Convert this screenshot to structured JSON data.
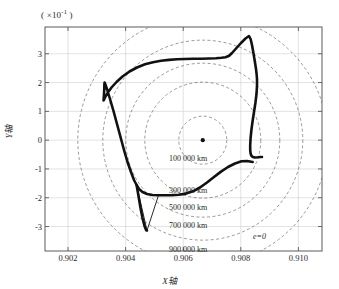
{
  "figure": {
    "exponent_note": "( ×10",
    "exponent_power": "-1",
    "exponent_close": " )",
    "x_axis_label": "X轴",
    "y_axis_label": "Y轴",
    "eccentricity_note": "e=0"
  },
  "chart_data": {
    "type": "line",
    "title": "",
    "subtitle": "",
    "xlabel": "X轴",
    "ylabel": "Y轴",
    "y_scale_note": "( ×10^-1 )",
    "grid": true,
    "legend_position": "none",
    "xlim": [
      0.9012,
      0.91082
    ],
    "ylim": [
      -0.385,
      0.393
    ],
    "x_ticks": [
      0.902,
      0.904,
      0.906,
      0.908,
      0.91
    ],
    "x_tick_labels": [
      "0.902",
      "0.904",
      "0.906",
      "0.908",
      "0.910"
    ],
    "y_ticks": [
      3,
      2,
      1,
      0,
      -1,
      -2,
      -3
    ],
    "y_tick_labels": [
      "3",
      "2",
      "1",
      "0",
      "-1",
      "-2",
      "-3"
    ],
    "center": {
      "x": 0.90668,
      "y": 0.0
    },
    "center_marker": "dot",
    "rings": [
      {
        "label": "100 000 km",
        "radius_px": 24,
        "label_y": 154
      },
      {
        "label": "300 000 km",
        "radius_px": 58,
        "label_y": 186
      },
      {
        "label": "500 000 km",
        "radius_px": 77,
        "label_y": 203
      },
      {
        "label": "700 000 km",
        "radius_px": 100,
        "label_y": 221
      },
      {
        "label": "900 000 km",
        "radius_px": 125,
        "label_y": 245
      }
    ],
    "ring_label_x": 188,
    "series": [
      {
        "name": "trajectory",
        "color": "#111111",
        "linewidth": 2.6,
        "closed": false,
        "points_px": [
          [
            252.7,
            162.0
          ],
          [
            247.0,
            161.0
          ],
          [
            241.5,
            161.3
          ],
          [
            235.0,
            163.5
          ],
          [
            228.0,
            167.0
          ],
          [
            221.0,
            171.6
          ],
          [
            214.0,
            177.0
          ],
          [
            207.0,
            182.5
          ],
          [
            200.0,
            187.5
          ],
          [
            193.0,
            191.3
          ],
          [
            186.0,
            193.6
          ],
          [
            179.0,
            194.7
          ],
          [
            172.0,
            195.1
          ],
          [
            165.0,
            195.2
          ],
          [
            158.5,
            195.3
          ],
          [
            152.5,
            195.0
          ],
          [
            147.0,
            194.0
          ],
          [
            142.5,
            192.0
          ],
          [
            139.0,
            189.0
          ],
          [
            136.6,
            185.0
          ],
          [
            134.0,
            180.0
          ],
          [
            131.0,
            172.0
          ],
          [
            127.5,
            162.0
          ],
          [
            124.0,
            150.0
          ],
          [
            120.5,
            137.0
          ],
          [
            117.0,
            124.0
          ],
          [
            113.5,
            111.0
          ],
          [
            110.0,
            99.0
          ],
          [
            107.3,
            90.0
          ],
          [
            105.4,
            84.5
          ],
          [
            104.6,
            82.5
          ],
          [
            104.4,
            84.0
          ],
          [
            104.3,
            88.0
          ],
          [
            104.0,
            94.5
          ],
          [
            103.6,
            99.5
          ],
          [
            103.6,
            100.5
          ],
          [
            104.8,
            98.0
          ],
          [
            107.5,
            93.0
          ],
          [
            111.5,
            87.5
          ],
          [
            116.5,
            82.0
          ],
          [
            122.5,
            76.5
          ],
          [
            129.5,
            71.5
          ],
          [
            137.0,
            67.5
          ],
          [
            145.0,
            64.3
          ],
          [
            153.0,
            62.2
          ],
          [
            161.0,
            60.8
          ],
          [
            169.0,
            59.9
          ],
          [
            177.0,
            59.3
          ],
          [
            185.0,
            59.0
          ],
          [
            193.0,
            58.8
          ],
          [
            201.0,
            58.7
          ],
          [
            209.0,
            58.5
          ],
          [
            216.0,
            58.2
          ],
          [
            221.5,
            57.8
          ],
          [
            225.5,
            57.2
          ],
          [
            228.0,
            56.3
          ],
          [
            229.4,
            55.5
          ],
          [
            232.0,
            53.0
          ],
          [
            236.5,
            48.0
          ],
          [
            241.0,
            43.0
          ],
          [
            245.5,
            38.5
          ],
          [
            249.0,
            36.0
          ],
          [
            250.6,
            39.0
          ],
          [
            252.0,
            45.0
          ],
          [
            253.5,
            53.5
          ],
          [
            255.0,
            62.5
          ],
          [
            256.0,
            69.0
          ],
          [
            256.6,
            74.0
          ],
          [
            257.0,
            79.0
          ],
          [
            257.0,
            86.0
          ],
          [
            256.5,
            94.0
          ],
          [
            255.4,
            103.0
          ],
          [
            254.0,
            112.0
          ],
          [
            252.6,
            121.0
          ],
          [
            251.4,
            130.0
          ],
          [
            250.6,
            138.0
          ],
          [
            250.2,
            145.0
          ],
          [
            250.2,
            150.0
          ],
          [
            250.6,
            153.5
          ],
          [
            251.4,
            155.8
          ],
          [
            252.8,
            157.0
          ],
          [
            255.0,
            157.5
          ],
          [
            257.8,
            157.3
          ],
          [
            260.4,
            157.0
          ],
          [
            262.0,
            157.0
          ]
        ],
        "spike_segments_px": [
          [
            [
              229.4,
              55.5
            ],
            [
              249.0,
              36.0
            ]
          ],
          [
            [
              136.6,
              185.0
            ],
            [
              147.0,
              230.5
            ]
          ],
          [
            [
              147.0,
              230.5
            ],
            [
              158.5,
              195.3
            ]
          ]
        ],
        "lower_tail_px": [
          [
            136.6,
            185.0
          ],
          [
            138.5,
            196.0
          ],
          [
            140.5,
            208.0
          ],
          [
            142.5,
            218.0
          ],
          [
            144.5,
            226.0
          ],
          [
            146.2,
            230.2
          ],
          [
            147.0,
            230.5
          ]
        ]
      }
    ],
    "annotations": [
      {
        "text": "e=0",
        "x_px": 253,
        "y_px": 232
      }
    ]
  }
}
